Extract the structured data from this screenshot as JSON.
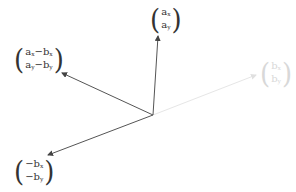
{
  "diagram": {
    "origin": [
      153,
      115
    ],
    "vectors": [
      {
        "id": "a",
        "end": [
          158,
          36
        ],
        "color": "#555555",
        "label": {
          "top": "a",
          "top_sub": "x",
          "bottom": "a",
          "bottom_sub": "y"
        }
      },
      {
        "id": "b",
        "end": [
          256,
          75
        ],
        "color": "#e4e4e4",
        "label": {
          "top": "b",
          "top_sub": "x",
          "bottom": "b",
          "bottom_sub": "y"
        }
      },
      {
        "id": "a_minus_b",
        "end": [
          62,
          73
        ],
        "color": "#555555",
        "label": {
          "top": "a",
          "top_sub": "x",
          "top_rest": "−b",
          "top_rest_sub": "x",
          "bottom": "a",
          "bottom_sub": "y",
          "bottom_rest": "−b",
          "bottom_rest_sub": "y"
        }
      },
      {
        "id": "neg_b",
        "end": [
          48,
          155
        ],
        "color": "#555555",
        "label": {
          "top": "−b",
          "top_sub": "x",
          "bottom": "−b",
          "bottom_sub": "y"
        }
      }
    ]
  },
  "labels": {
    "a": {
      "top": "a",
      "top_sub": "x",
      "bottom": "a",
      "bottom_sub": "y"
    },
    "b": {
      "top": "b",
      "top_sub": "x",
      "bottom": "b",
      "bottom_sub": "y"
    },
    "a_minus_b": {
      "top": "a",
      "top_sub": "x",
      "top_op": "−b",
      "top_op_sub": "x",
      "bottom": "a",
      "bottom_sub": "y",
      "bottom_op": "−b",
      "bottom_op_sub": "y"
    },
    "neg_b": {
      "top": "−b",
      "top_sub": "x",
      "bottom": "−b",
      "bottom_sub": "y"
    },
    "paren_left": "(",
    "paren_right": ")"
  }
}
